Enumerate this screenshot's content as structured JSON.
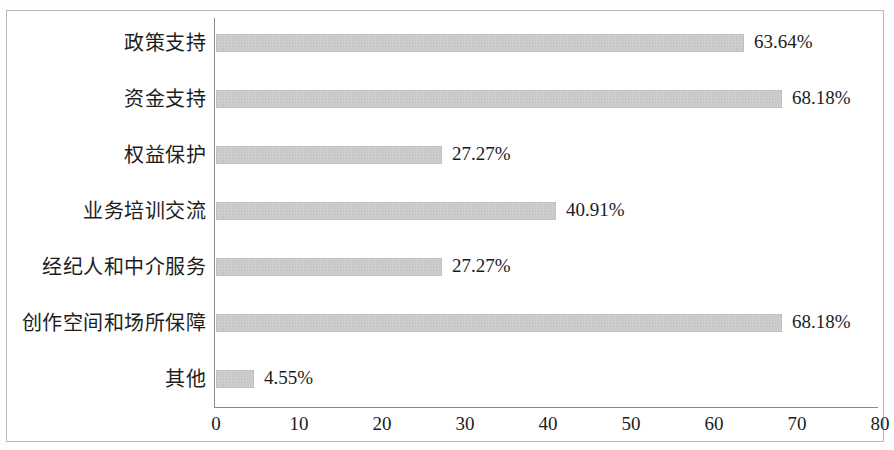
{
  "chart_data": {
    "type": "bar",
    "orientation": "horizontal",
    "title": "",
    "subtitle": "",
    "xlabel": "",
    "ylabel": "",
    "categories": [
      "政策支持",
      "资金支持",
      "权益保护",
      "业务培训交流",
      "经纪人和中介服务",
      "创作空间和场所保障",
      "其他"
    ],
    "values": [
      63.64,
      68.18,
      27.27,
      40.91,
      27.27,
      68.18,
      4.55
    ],
    "data_labels": [
      "63.64%",
      "68.18%",
      "27.27%",
      "40.91%",
      "27.27%",
      "68.18%",
      "4.55%"
    ],
    "xlim": [
      0,
      80
    ],
    "x_ticks": [
      0,
      10,
      20,
      30,
      40,
      50,
      60,
      70,
      80
    ],
    "x_tick_labels": [
      "0",
      "10",
      "20",
      "30",
      "40",
      "50",
      "60",
      "70",
      "80"
    ],
    "grid": false,
    "legend": null,
    "bar_color": "#c9c9c9",
    "axis_color": "#8a8a8a",
    "text_color": "#1c1c1c",
    "frame_color": "#b9b9b9"
  }
}
